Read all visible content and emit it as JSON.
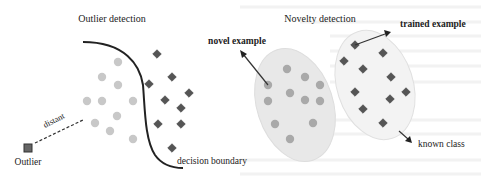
{
  "outlier_panel": {
    "title": "Outlier detection",
    "outlier_label": "Outlier",
    "distant_label": "distant",
    "boundary_label": "decision boundary",
    "inlier_circles": [
      [
        118,
        62
      ],
      [
        102,
        77
      ],
      [
        118,
        85
      ],
      [
        87,
        101
      ],
      [
        102,
        101
      ],
      [
        133,
        101
      ],
      [
        117,
        116
      ],
      [
        95,
        123
      ],
      [
        110,
        131
      ],
      [
        133,
        139
      ]
    ],
    "class_diamonds": [
      [
        157,
        54
      ],
      [
        172,
        77
      ],
      [
        149,
        84
      ],
      [
        189,
        93
      ],
      [
        165,
        100
      ],
      [
        181,
        108
      ],
      [
        158,
        124
      ],
      [
        181,
        124
      ],
      [
        172,
        148
      ]
    ],
    "outlier_square": [
      28,
      148
    ]
  },
  "novelty_panel": {
    "title": "Novelty detection",
    "novel_label": "novel example",
    "trained_label": "trained example",
    "known_class_label": "known class",
    "novel_circles": [
      [
        287,
        69
      ],
      [
        305,
        77
      ],
      [
        268,
        85
      ],
      [
        320,
        85
      ],
      [
        290,
        93
      ],
      [
        305,
        100
      ],
      [
        268,
        101
      ],
      [
        320,
        101
      ],
      [
        275,
        124
      ],
      [
        313,
        123
      ],
      [
        290,
        139
      ]
    ],
    "trained_diamonds": [
      [
        355,
        45
      ],
      [
        383,
        53
      ],
      [
        344,
        61
      ],
      [
        363,
        69
      ],
      [
        391,
        77
      ],
      [
        355,
        92
      ],
      [
        406,
        92
      ],
      [
        390,
        99
      ],
      [
        363,
        109
      ],
      [
        383,
        123
      ]
    ]
  },
  "colors": {
    "circle_light": "#c8c8c8",
    "circle_mid": "#a9a9a9",
    "diamond": "#555555",
    "outlier": "#666666",
    "boundary": "#222222",
    "ellipse_left": "#e9e9e9",
    "ellipse_right": "#f1f1f1"
  }
}
